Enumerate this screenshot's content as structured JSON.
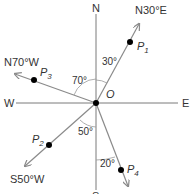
{
  "compass": {
    "north": "N",
    "south": "S",
    "east": "E",
    "west": "W",
    "origin": "O"
  },
  "bearings": [
    {
      "id": "p1",
      "label": "N30°E",
      "point": "P",
      "sub": "1",
      "angle_label": "30°"
    },
    {
      "id": "p3",
      "label": "N70°W",
      "point": "P",
      "sub": "3",
      "angle_label": "70°"
    },
    {
      "id": "p2",
      "label": "S50°W",
      "point": "P",
      "sub": "2",
      "angle_label": "50°"
    },
    {
      "id": "p4",
      "label": "",
      "point": "P",
      "sub": "4",
      "angle_label": "20°"
    }
  ],
  "colors": {
    "axis": "#7a7a7a",
    "ray": "#8a8a8a",
    "point": "#000000",
    "text": "#333333"
  }
}
